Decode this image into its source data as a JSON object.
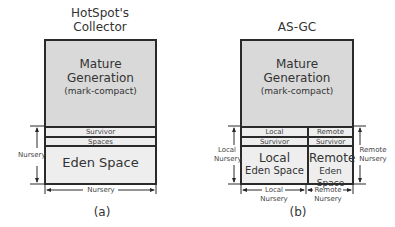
{
  "panel_a": {
    "title_line1": "HotSpot's",
    "title_line2": "Collector",
    "mature_line1": "Mature",
    "mature_line2": "Generation",
    "mature_line3": "(mark-compact)",
    "survivor_label": "Survivor",
    "spaces_label": "Spaces",
    "eden_label": "Eden Space",
    "nursery_vertical_label": "Nursery",
    "nursery_horizontal_label": "Nursery",
    "caption": "(a)"
  },
  "panel_b": {
    "title": "AS-GC",
    "mature_line1": "Mature",
    "mature_line2": "Generation",
    "mature_line3": "(mark-compact)",
    "local_survivor_line1": "Local",
    "local_survivor_line2": "Survivor",
    "remote_survivor_line1": "Remote",
    "remote_survivor_line2": "Survivor",
    "local_eden_line1": "Local",
    "local_eden_line2": "Eden Space",
    "remote_eden_line1": "Remote",
    "remote_eden_line2": "Eden Space",
    "left_label_line1": "Local",
    "left_label_line2": "Nursery",
    "right_label_line1": "Remote",
    "right_label_line2": "Nursery",
    "bottom_local_line1": "Local",
    "bottom_local_line2": "Nursery",
    "bottom_remote_line1": "Remote",
    "bottom_remote_line2": "Nursery",
    "caption": "(b)"
  },
  "colors": {
    "mature_fill": "#d9d9d9",
    "nursery_fill": "#eeeeee",
    "stroke": "#2a2a2a"
  }
}
